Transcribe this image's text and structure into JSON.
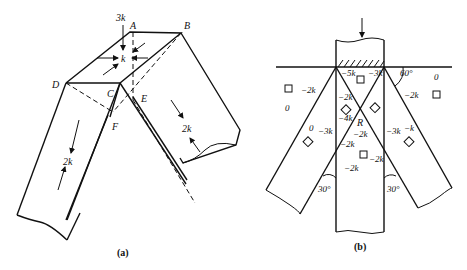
{
  "figure_a": {
    "caption": "(a)",
    "vertices": {
      "A": "A",
      "B": "B",
      "C": "C",
      "D": "D",
      "E": "E",
      "F": "F"
    },
    "loads": {
      "top": "3k",
      "center": "k",
      "left_leg": "2k",
      "right_leg": "2k"
    }
  },
  "figure_b": {
    "caption": "(b)",
    "angle_top": "60°",
    "angle_left": "30°",
    "angle_right": "30°",
    "region_label": "R",
    "left_element": {
      "right": "−2k",
      "bottom": "0"
    },
    "right_element": {
      "top": "0",
      "left": "−2k"
    },
    "top_element": {
      "left": "−5k",
      "right": "−3k"
    },
    "post_left": {
      "upper": "−2k",
      "lower": "−4k"
    },
    "left_leg_element": {
      "a": "0",
      "b": "−3k"
    },
    "right_leg_element": {
      "a": "−3k",
      "b": "−k"
    },
    "center_element": {
      "top": "−2k",
      "left": "−2k",
      "right": "−2k",
      "bottom": "−2k"
    }
  }
}
